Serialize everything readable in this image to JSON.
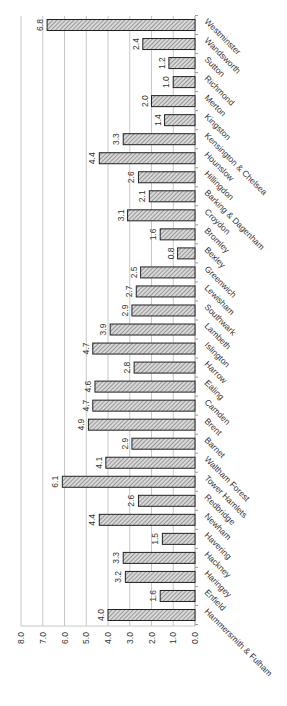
{
  "chart_data": {
    "type": "bar",
    "orientation": "rotated-90-clockwise",
    "title": "",
    "xlabel": "",
    "ylabel": "",
    "ylim": [
      0,
      8
    ],
    "y_ticks": [
      "0.0",
      "1.0",
      "2.0",
      "3.0",
      "4.0",
      "5.0",
      "6.0",
      "7.0",
      "8.0"
    ],
    "grid": true,
    "legend": null,
    "bar_pattern": "diagonal-hatch",
    "bar_fill": "#bdbdbd",
    "bar_stroke": "#222222",
    "grid_color": "#c8c8c8",
    "categories": [
      "Hammersmith & Fulham",
      "Enfield",
      "Haringey",
      "Hackney",
      "Havering",
      "Newham",
      "Redbridge",
      "Tower Hamlets",
      "Waltham Forest",
      "Barnet",
      "Brent",
      "Camden",
      "Ealing",
      "Harrow",
      "Islington",
      "Lambeth",
      "Southwark",
      "Lewisham",
      "Greenwich",
      "Bexley",
      "Bromley",
      "Croydon",
      "Barking & Dagenham",
      "Hillingdon",
      "Hounslow",
      "Kensington & Chelsea",
      "Kingston",
      "Merton",
      "Richmond",
      "Sutton",
      "Wandsworth",
      "Westminster"
    ],
    "values": [
      4.0,
      1.6,
      3.2,
      3.3,
      1.5,
      4.4,
      2.6,
      6.1,
      4.1,
      2.9,
      4.9,
      4.7,
      4.6,
      2.8,
      4.7,
      3.9,
      2.9,
      2.7,
      2.5,
      0.8,
      1.6,
      3.1,
      2.1,
      2.6,
      4.4,
      3.3,
      1.4,
      2.0,
      1.0,
      1.2,
      2.4,
      6.8
    ],
    "data_labels": [
      "4.0",
      "1.6",
      "3.2",
      "3.3",
      "1.5",
      "4.4",
      "2.6",
      "6.1",
      "4.1",
      "2.9",
      "4.9",
      "4.7",
      "4.6",
      "2.8",
      "4.7",
      "3.9",
      "2.9",
      "2.7",
      "2.5",
      "0.8",
      "1.6",
      "3.1",
      "2.1",
      "2.6",
      "4.4",
      "3.3",
      "1.4",
      "2.0",
      "1.0",
      "1.2",
      "2.4",
      "6.8"
    ]
  }
}
